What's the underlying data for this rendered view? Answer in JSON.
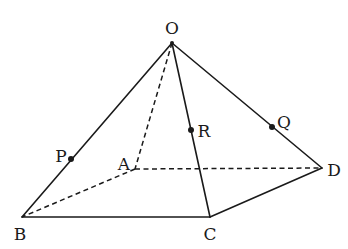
{
  "diagram": {
    "vertices": {
      "O": {
        "label": "O",
        "x": 172,
        "y": 43,
        "lx": 172,
        "ly": 34
      },
      "A": {
        "label": "A",
        "x": 135,
        "y": 169,
        "lx": 124,
        "ly": 170
      },
      "B": {
        "label": "B",
        "x": 22,
        "y": 217,
        "lx": 20,
        "ly": 240
      },
      "C": {
        "label": "C",
        "x": 210,
        "y": 217,
        "lx": 210,
        "ly": 240
      },
      "D": {
        "label": "D",
        "x": 322,
        "y": 168,
        "lx": 334,
        "ly": 176
      }
    },
    "points": {
      "P": {
        "label": "P",
        "x": 71,
        "y": 159,
        "lx": 61,
        "ly": 162
      },
      "R": {
        "label": "R",
        "x": 191,
        "y": 130,
        "lx": 204,
        "ly": 137
      },
      "Q": {
        "label": "Q",
        "x": 272,
        "y": 127,
        "lx": 284,
        "ly": 128
      }
    },
    "visible_edges": [
      "OB",
      "OC",
      "OD",
      "BC",
      "CD"
    ],
    "hidden_edges": [
      "OA",
      "AB",
      "AD"
    ]
  }
}
